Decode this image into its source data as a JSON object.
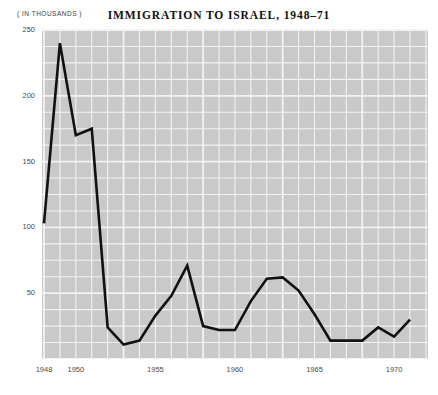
{
  "units_note": "( IN THOUSANDS )",
  "chart_data": {
    "type": "line",
    "title": "IMMIGRATION TO ISRAEL, 1948–71",
    "xlabel": "",
    "ylabel": "( IN THOUSANDS )",
    "grid": true,
    "legend": "none",
    "xlim": [
      1948,
      1971
    ],
    "ylim": [
      0,
      250
    ],
    "ytick_labels": [
      "250",
      "200",
      "150",
      "100",
      "50"
    ],
    "ytick_values": [
      250,
      200,
      150,
      100,
      50
    ],
    "xtick_labels": [
      "1948",
      "1950",
      "1955",
      "1960",
      "1965",
      "1970"
    ],
    "xtick_values": [
      1948,
      1950,
      1955,
      1960,
      1965,
      1970
    ],
    "x": [
      1948,
      1949,
      1950,
      1951,
      1952,
      1953,
      1954,
      1955,
      1956,
      1957,
      1958,
      1959,
      1960,
      1961,
      1962,
      1963,
      1964,
      1965,
      1966,
      1967,
      1968,
      1969,
      1970,
      1971
    ],
    "values": [
      103,
      240,
      170,
      175,
      24,
      11,
      14,
      33,
      48,
      71,
      25,
      22,
      22,
      44,
      61,
      62,
      52,
      34,
      14,
      14,
      14,
      24,
      17,
      30
    ],
    "series": [
      {
        "name": "Immigration to Israel",
        "values": [
          103,
          240,
          170,
          175,
          24,
          11,
          14,
          33,
          48,
          71,
          25,
          22,
          22,
          44,
          61,
          62,
          52,
          34,
          14,
          14,
          14,
          24,
          17,
          30
        ]
      }
    ],
    "line_color": "#111111",
    "plot_background": "#c9c9c9",
    "grid_color": "#f2f2f2",
    "page_background": "#ffffff"
  }
}
